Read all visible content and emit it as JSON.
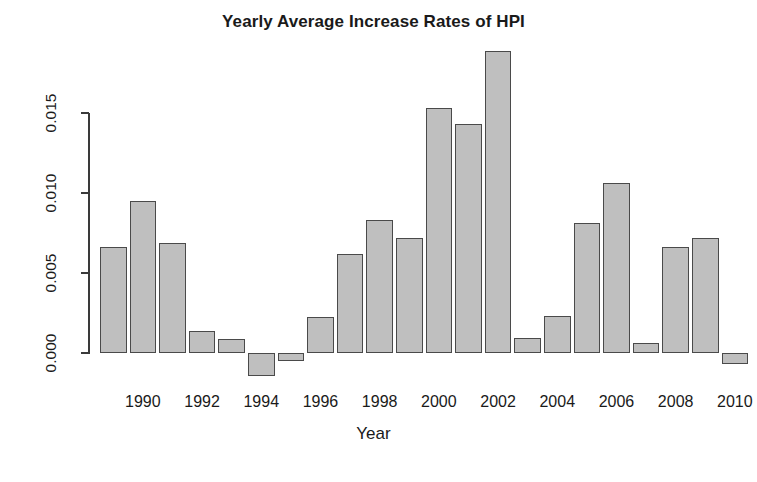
{
  "chart_data": {
    "type": "bar",
    "title": "Yearly Average Increase Rates of HPI",
    "xlabel": "Year",
    "ylabel": "",
    "categories": [
      1989,
      1990,
      1991,
      1992,
      1993,
      1994,
      1995,
      1996,
      1997,
      1998,
      1999,
      2000,
      2001,
      2002,
      2003,
      2004,
      2005,
      2006,
      2007,
      2008,
      2009,
      2010,
      2011
    ],
    "values": [
      0.00663,
      0.00951,
      0.00688,
      0.00138,
      0.00088,
      -0.00144,
      -0.0005,
      0.00225,
      0.00619,
      0.00831,
      0.00719,
      0.01531,
      0.01431,
      0.01888,
      0.00094,
      0.00231,
      0.00812,
      0.01063,
      0.00063,
      0.00663,
      0.00719,
      -0.00069,
      0.0
    ],
    "bars": [
      {
        "year": 1989,
        "value": 0.00663
      },
      {
        "year": 1990,
        "value": 0.00951
      },
      {
        "year": 1991,
        "value": 0.00688
      },
      {
        "year": 1992,
        "value": 0.00138
      },
      {
        "year": 1993,
        "value": 0.00088
      },
      {
        "year": 1994,
        "value": -0.00144
      },
      {
        "year": 1995,
        "value": -0.0005
      },
      {
        "year": 1996,
        "value": 0.00225
      },
      {
        "year": 1997,
        "value": 0.00619
      },
      {
        "year": 1998,
        "value": 0.00831
      },
      {
        "year": 1999,
        "value": 0.00719
      },
      {
        "year": 2000,
        "value": 0.01531
      },
      {
        "year": 2001,
        "value": 0.01431
      },
      {
        "year": 2002,
        "value": 0.01888
      },
      {
        "year": 2003,
        "value": 0.00094
      },
      {
        "year": 2004,
        "value": 0.00231
      },
      {
        "year": 2005,
        "value": 0.00812
      },
      {
        "year": 2006,
        "value": 0.01063
      },
      {
        "year": 2007,
        "value": 0.00063
      },
      {
        "year": 2008,
        "value": 0.00663
      },
      {
        "year": 2009,
        "value": 0.00719
      },
      {
        "year": 2010,
        "value": -0.00069
      }
    ],
    "y_ticks": [
      {
        "label": "0.000",
        "value": 0.0
      },
      {
        "label": "0.005",
        "value": 0.005
      },
      {
        "label": "0.010",
        "value": 0.01
      },
      {
        "label": "0.015",
        "value": 0.015
      }
    ],
    "x_ticks": [
      {
        "label": "1990",
        "value": 1990
      },
      {
        "label": "1992",
        "value": 1992
      },
      {
        "label": "1994",
        "value": 1994
      },
      {
        "label": "1996",
        "value": 1996
      },
      {
        "label": "1998",
        "value": 1998
      },
      {
        "label": "2000",
        "value": 2000
      },
      {
        "label": "2002",
        "value": 2002
      },
      {
        "label": "2004",
        "value": 2004
      },
      {
        "label": "2006",
        "value": 2006
      },
      {
        "label": "2008",
        "value": 2008
      },
      {
        "label": "2010",
        "value": 2010
      }
    ],
    "ylim": [
      -0.0025,
      0.0195
    ],
    "grid": false,
    "legend": null,
    "colors": {
      "bar_fill": "#bfbfbf",
      "bar_border": "#4a4a4a",
      "axis": "#3a3a3a",
      "text": "#1a1a1a",
      "background": "#ffffff"
    }
  }
}
